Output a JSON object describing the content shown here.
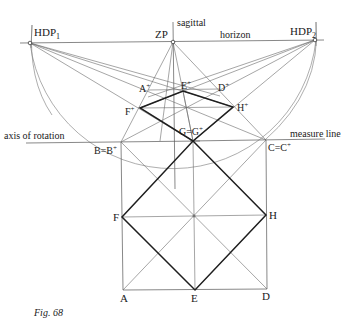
{
  "figure": {
    "caption": "Fig. 68",
    "labels": {
      "hdp1": "HDP",
      "hdp1_sub": "1",
      "hdp2": "HDP",
      "hdp2_sub": "2",
      "zp": "ZP",
      "sagittal": "sagittal",
      "horizon": "horizon",
      "axis_of_rotation": "axis of rotation",
      "measure_line": "measure line",
      "a_plus": "A",
      "e_plus": "E",
      "d_plus": "D",
      "f_plus": "F",
      "h_plus": "H",
      "plus": "+",
      "g_eq": "G=G",
      "b_eq": "B=B",
      "c_eq": "C=C",
      "f": "F",
      "h": "H",
      "a": "A",
      "e": "E",
      "d": "D"
    },
    "points": {
      "HDP1": [
        30,
        43
      ],
      "ZP": [
        173,
        42
      ],
      "HDP2": [
        315,
        40
      ],
      "A+": [
        148,
        90
      ],
      "E+": [
        183,
        91
      ],
      "D+": [
        220,
        89
      ],
      "F+": [
        140,
        108
      ],
      "H+": [
        233,
        107
      ],
      "B": [
        121,
        142
      ],
      "G": [
        193,
        141
      ],
      "C": [
        266,
        140
      ],
      "F": [
        122,
        217
      ],
      "H": [
        266,
        215
      ],
      "A": [
        123,
        290
      ],
      "E": [
        195,
        290
      ],
      "D": [
        267,
        289
      ]
    }
  }
}
